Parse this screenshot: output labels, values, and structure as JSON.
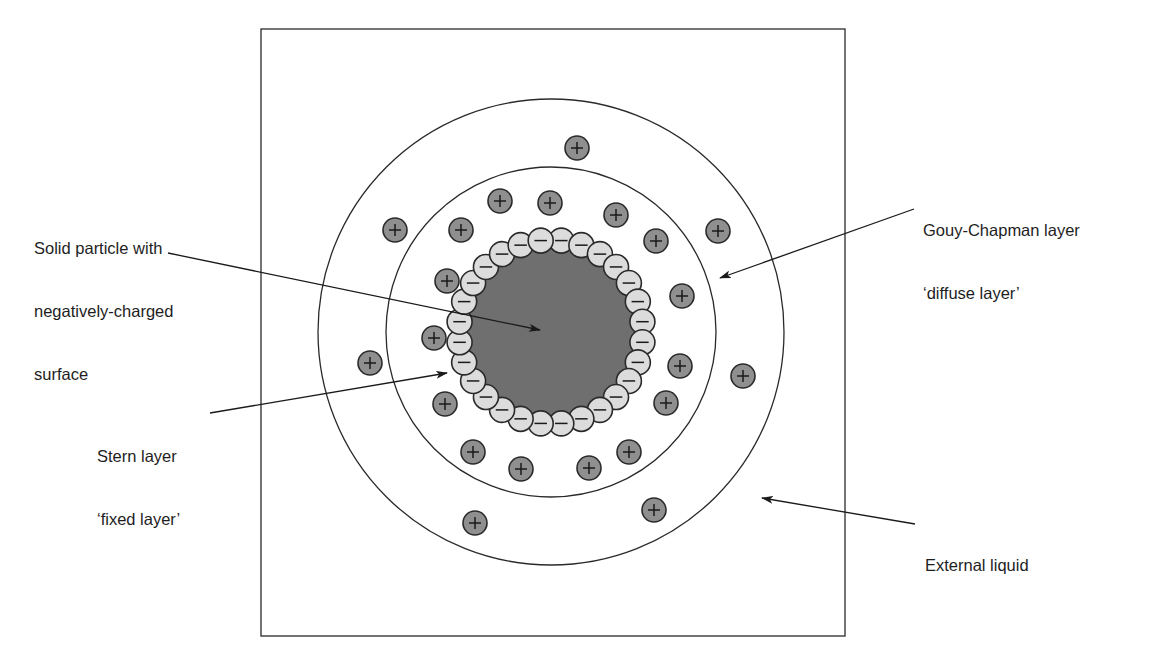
{
  "diagram": {
    "frame": {
      "x": 261,
      "y": 29,
      "width": 584,
      "height": 607
    },
    "colors": {
      "line": "#2a2a2a",
      "core_fill": "#6f6f6f",
      "negative_ion_fill": "#dcdcdc",
      "positive_ion_fill": "#8f8f8f",
      "background": "#ffffff"
    },
    "center": {
      "x": 551,
      "y": 332
    },
    "circles": {
      "diffuse_layer_outer": {
        "r": 233
      },
      "stern_layer_outer": {
        "r": 165
      },
      "particle_core": {
        "r": 84
      }
    },
    "negative_ions": {
      "ring_radius": 92,
      "count": 28,
      "ion_radius": 12.5,
      "symbol": "−"
    },
    "positive_ions": {
      "ion_radius": 12,
      "symbol": "+",
      "positions": [
        [
          577,
          148
        ],
        [
          395,
          230
        ],
        [
          461,
          230
        ],
        [
          500,
          201
        ],
        [
          550,
          203
        ],
        [
          616,
          215
        ],
        [
          656,
          241
        ],
        [
          718,
          231
        ],
        [
          682,
          296
        ],
        [
          447,
          281
        ],
        [
          434,
          338
        ],
        [
          370,
          363
        ],
        [
          680,
          366
        ],
        [
          743,
          376
        ],
        [
          445,
          404
        ],
        [
          666,
          403
        ],
        [
          473,
          452
        ],
        [
          521,
          469
        ],
        [
          589,
          468
        ],
        [
          629,
          452
        ],
        [
          654,
          510
        ],
        [
          475,
          523
        ]
      ]
    }
  },
  "labels": {
    "solid_particle": {
      "lines": [
        "Solid particle with",
        "negatively-charged",
        "surface"
      ],
      "x": 34,
      "y": 196
    },
    "stern_layer": {
      "lines": [
        "Stern layer",
        "‘fixed layer’"
      ],
      "x": 97,
      "y": 404
    },
    "gouy_chapman": {
      "lines": [
        "Gouy-Chapman layer",
        "‘diffuse layer’"
      ],
      "x": 923,
      "y": 178
    },
    "external_liquid": {
      "lines": [
        "External liquid"
      ],
      "x": 925,
      "y": 513
    }
  },
  "arrows": {
    "solid_particle": {
      "from": [
        168,
        253
      ],
      "to": [
        540,
        330
      ]
    },
    "stern_layer": {
      "from": [
        210,
        413
      ],
      "to": [
        447,
        373
      ]
    },
    "gouy_chapman": {
      "from": [
        914,
        209
      ],
      "to": [
        720,
        278
      ]
    },
    "external_liquid": {
      "from": [
        915,
        524
      ],
      "to": [
        762,
        498
      ]
    }
  }
}
